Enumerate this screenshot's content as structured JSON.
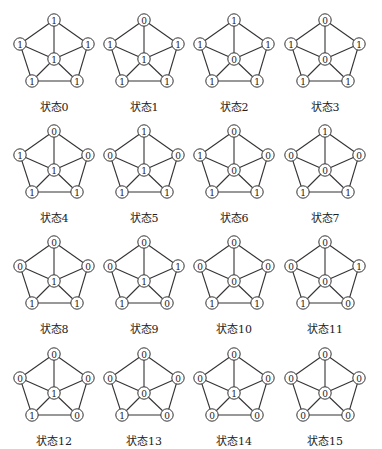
{
  "figure": {
    "layout": {
      "columns_x": [
        4,
        94,
        184,
        275
      ],
      "rows_y": [
        0,
        111,
        222,
        334
      ],
      "node_positions": {
        "top": [
          50,
          20
        ],
        "left": [
          16,
          44
        ],
        "right": [
          84,
          44
        ],
        "center": [
          50,
          59
        ],
        "bottom_left": [
          28,
          81
        ],
        "bottom_right": [
          73,
          81
        ]
      },
      "node_order": [
        "top",
        "left",
        "right",
        "center",
        "bottom_left",
        "bottom_right"
      ],
      "edges": [
        [
          "top",
          "left"
        ],
        [
          "top",
          "right"
        ],
        [
          "left",
          "bottom_left"
        ],
        [
          "right",
          "bottom_right"
        ],
        [
          "bottom_left",
          "bottom_right"
        ],
        [
          "center",
          "top"
        ],
        [
          "center",
          "left"
        ],
        [
          "center",
          "right"
        ],
        [
          "center",
          "bottom_left"
        ],
        [
          "center",
          "bottom_right"
        ]
      ]
    },
    "states": [
      {
        "label": "状态0",
        "values": [
          "1",
          "1",
          "1",
          "1",
          "1",
          "1"
        ]
      },
      {
        "label": "状态1",
        "values": [
          "0",
          "1",
          "1",
          "1",
          "1",
          "1"
        ]
      },
      {
        "label": "状态2",
        "values": [
          "1",
          "1",
          "1",
          "0",
          "1",
          "1"
        ]
      },
      {
        "label": "状态3",
        "values": [
          "0",
          "1",
          "1",
          "0",
          "1",
          "1"
        ]
      },
      {
        "label": "状态4",
        "values": [
          "0",
          "1",
          "0",
          "1",
          "1",
          "1"
        ]
      },
      {
        "label": "状态5",
        "values": [
          "1",
          "0",
          "0",
          "1",
          "1",
          "1"
        ]
      },
      {
        "label": "状态6",
        "values": [
          "0",
          "1",
          "0",
          "0",
          "1",
          "1"
        ]
      },
      {
        "label": "状态7",
        "values": [
          "1",
          "0",
          "0",
          "0",
          "1",
          "1"
        ]
      },
      {
        "label": "状态8",
        "values": [
          "0",
          "0",
          "0",
          "1",
          "1",
          "1"
        ]
      },
      {
        "label": "状态9",
        "values": [
          "0",
          "0",
          "1",
          "1",
          "1",
          "0"
        ]
      },
      {
        "label": "状态10",
        "values": [
          "0",
          "0",
          "0",
          "0",
          "1",
          "1"
        ]
      },
      {
        "label": "状态11",
        "values": [
          "0",
          "0",
          "1",
          "0",
          "1",
          "0"
        ]
      },
      {
        "label": "状态12",
        "values": [
          "0",
          "0",
          "0",
          "1",
          "1",
          "0"
        ]
      },
      {
        "label": "状态13",
        "values": [
          "0",
          "0",
          "0",
          "0",
          "1",
          "0"
        ]
      },
      {
        "label": "状态14",
        "values": [
          "0",
          "0",
          "0",
          "1",
          "0",
          "0"
        ]
      },
      {
        "label": "状态15",
        "values": [
          "0",
          "0",
          "0",
          "0",
          "0",
          "0"
        ]
      }
    ]
  }
}
